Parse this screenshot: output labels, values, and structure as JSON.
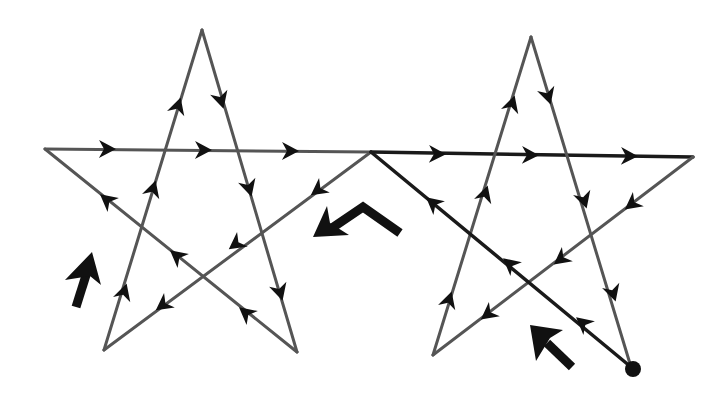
{
  "diagram": {
    "title": "Two connected pentagrams drawn as one continuous directed path",
    "colors": {
      "background": "#ffffff",
      "edge": "#555555",
      "edge_dark": "#1a1a1a",
      "arrow": "#111111"
    },
    "left_star": {
      "vertices": {
        "top": [
          202,
          30
        ],
        "left": [
          45,
          149
        ],
        "right_junction": [
          371,
          152
        ],
        "bottom_left": [
          104,
          350
        ],
        "bottom_right": [
          297,
          352
        ]
      }
    },
    "right_star": {
      "vertices": {
        "top": [
          531,
          37
        ],
        "left_junction": [
          371,
          152
        ],
        "right": [
          693,
          157
        ],
        "bottom_left": [
          433,
          355
        ],
        "bottom_right_start": [
          631,
          367
        ]
      }
    },
    "start_point": {
      "label": "start-dot",
      "position": [
        631,
        367
      ]
    },
    "path_order": [
      "start (631,367) -> right-star left junction (371,152)",
      "junction -> left-star bottom-left (104,350)",
      "left bottom-left -> left top (202,30)",
      "left top -> left bottom-right (297,352)",
      "left bottom-right -> left left (45,149)",
      "left left -> right-star right (693,157) via junction",
      "right right -> right bottom-left (433,355)",
      "right bottom-left -> right top (531,37)",
      "right top -> right bottom-right (631,367)"
    ],
    "large_direction_arrows": [
      {
        "name": "left-star-up-arrow",
        "direction": "up-right"
      },
      {
        "name": "middle-bent-arrow",
        "direction": "down-left"
      },
      {
        "name": "right-star-up-left-arrow",
        "direction": "up-left"
      }
    ]
  }
}
